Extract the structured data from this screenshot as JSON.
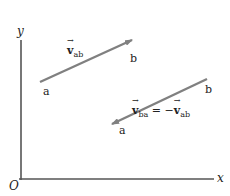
{
  "diagram": {
    "axes": {
      "y_label": "y",
      "x_label": "x",
      "origin_label": "O",
      "color": "#555555"
    },
    "arrows": [
      {
        "name": "v_ab",
        "start_label": "a",
        "end_label": "b",
        "vector_symbol": "v",
        "subscript": "ab",
        "label_text": "v_ab",
        "color": "#808080"
      },
      {
        "name": "v_ba",
        "start_label": "b",
        "end_label": "a",
        "vector_symbol": "v",
        "subscript": "ba",
        "equals": " = −",
        "rhs_symbol": "v",
        "rhs_subscript": "ab",
        "label_text": "v_ba = −v_ab",
        "color": "#808080"
      }
    ]
  }
}
